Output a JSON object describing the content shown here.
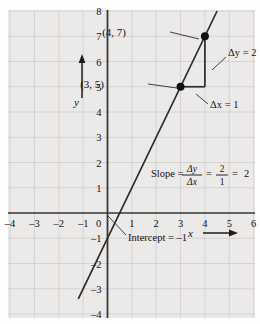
{
  "figure": {
    "background_color": "#eceae9",
    "grid_color": "#cfcdcb",
    "axis_color": "#3a3a3a",
    "line_color": "#2b2b2b",
    "point_color": "#111111",
    "axes": {
      "x_label": "x",
      "y_label": "y",
      "x_ticks": [
        "-4",
        "-3",
        "-2",
        "-1",
        "0",
        "1",
        "2",
        "3",
        "4",
        "5",
        "6"
      ],
      "y_ticks": [
        "8",
        "7",
        "6",
        "5",
        "4",
        "3",
        "2",
        "1",
        "-1",
        "-2",
        "-3",
        "-4"
      ],
      "x_range": [
        -4,
        6
      ],
      "y_range": [
        -4,
        8
      ]
    },
    "annotations": {
      "point_a_label": "(4, 7)",
      "point_b_label": "(3, 5)",
      "delta_y_label": "Δy = 2",
      "delta_x_label": "Δx = 1",
      "intercept_label": "Intercept = –1",
      "slope_word": "Slope =",
      "slope_num1": "Δy",
      "slope_den1": "Δx",
      "slope_eq1": "=",
      "slope_num2": "2",
      "slope_den2": "1",
      "slope_eq2": "=",
      "slope_result": "2"
    }
  },
  "chart_data": {
    "type": "line",
    "title": "",
    "xlabel": "x",
    "ylabel": "y",
    "xlim": [
      -4,
      6
    ],
    "ylim": [
      -4,
      8
    ],
    "grid": true,
    "legend": "none",
    "equation": "y = 2x - 1",
    "slope": 2,
    "intercept": -1,
    "series": [
      {
        "name": "y = 2x - 1",
        "x": [
          -1.2,
          4.5
        ],
        "y": [
          -3.4,
          8.0
        ]
      }
    ],
    "points": [
      {
        "label": "(3, 5)",
        "x": 3,
        "y": 5
      },
      {
        "label": "(4, 7)",
        "x": 4,
        "y": 7
      }
    ],
    "rise_run": {
      "delta_x": 1,
      "delta_y": 2
    }
  }
}
